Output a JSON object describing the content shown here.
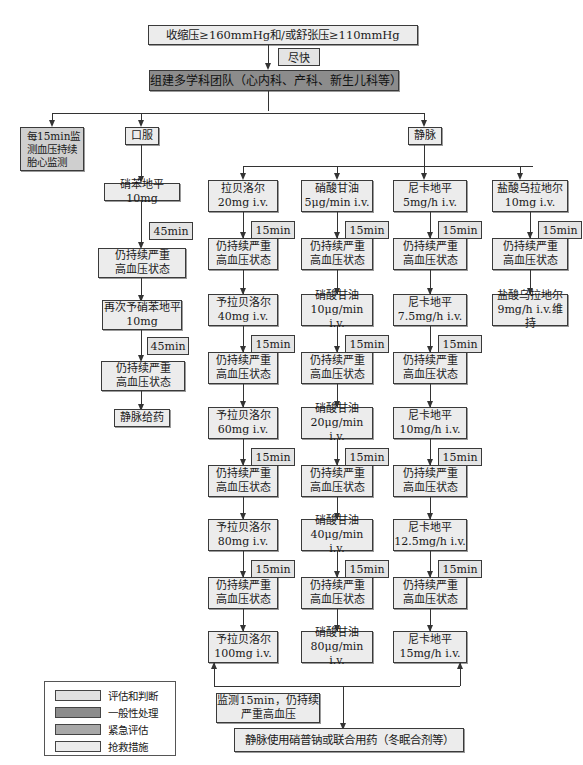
{
  "top": {
    "criteria": "收缩压≥160mmHg和/或舒张压≥110mmHg",
    "asap": "尽快",
    "team": "组建多学科团队（心内科、产科、新生儿科等）"
  },
  "branches": {
    "monitor": [
      "每15min监",
      "测血压持续",
      "胎心监测"
    ],
    "oral": "口服",
    "iv": "静脉"
  },
  "oral_path": {
    "step1": "硝苯地平10mg",
    "wait1": "45min",
    "persist1": [
      "仍持续严重",
      "高血压状态"
    ],
    "step2": [
      "再次予硝苯地平",
      "10mg"
    ],
    "wait2": "45min",
    "persist2": [
      "仍持续严重",
      "高血压状态"
    ],
    "final": "静脉给药"
  },
  "labetalol": {
    "doses": [
      [
        "拉贝洛尔",
        "20mg i.v."
      ],
      [
        "予拉贝洛尔",
        "40mg  i.v."
      ],
      [
        "予拉贝洛尔",
        "60mg  i.v."
      ],
      [
        "予拉贝洛尔",
        "80mg  i.v."
      ],
      [
        "予拉贝洛尔",
        "100mg  i.v."
      ]
    ],
    "wait": "15min",
    "persist": [
      "仍持续严重",
      "高血压状态"
    ]
  },
  "nitroglycerin": {
    "doses": [
      [
        "硝酸甘油",
        "5μg/min i.v."
      ],
      [
        "硝酸甘油",
        "10μg/min i.v."
      ],
      [
        "硝酸甘油",
        "20μg/min i.v."
      ],
      [
        "硝酸甘油",
        "40μg/min i.v."
      ],
      [
        "硝酸甘油",
        "80μg/min i.v."
      ]
    ],
    "wait": "15min",
    "persist": [
      "仍持续严重",
      "高血压状态"
    ]
  },
  "nicardipine": {
    "doses": [
      [
        "尼卡地平",
        "5mg/h i.v."
      ],
      [
        "尼卡地平",
        "7.5mg/h i.v."
      ],
      [
        "尼卡地平",
        "10mg/h i.v."
      ],
      [
        "尼卡地平",
        "12.5mg/h i.v."
      ],
      [
        "尼卡地平",
        "15mg/h i.v."
      ]
    ],
    "wait": "15min",
    "persist": [
      "仍持续严重",
      "高血压状态"
    ]
  },
  "urapidil": {
    "doses": [
      [
        "盐酸乌拉地尔",
        "10mg i.v."
      ],
      [
        "盐酸乌拉地尔",
        "9mg/h i.v.维持"
      ]
    ],
    "wait": "15min",
    "persist": [
      "仍持续严重",
      "高血压状态"
    ]
  },
  "bottom": {
    "monitor_note": [
      "监测15min，仍持续",
      "严重高血压"
    ],
    "final": "静脉使用硝普钠或联合用药（冬眠合剂等）"
  },
  "legend": [
    {
      "label": "评估和判断",
      "color": "#e0e0e0"
    },
    {
      "label": "一般性处理",
      "color": "#8c8c8c"
    },
    {
      "label": "紧急评估",
      "color": "#a8a8a8"
    },
    {
      "label": "抢救措施",
      "color": "#ececec"
    }
  ]
}
